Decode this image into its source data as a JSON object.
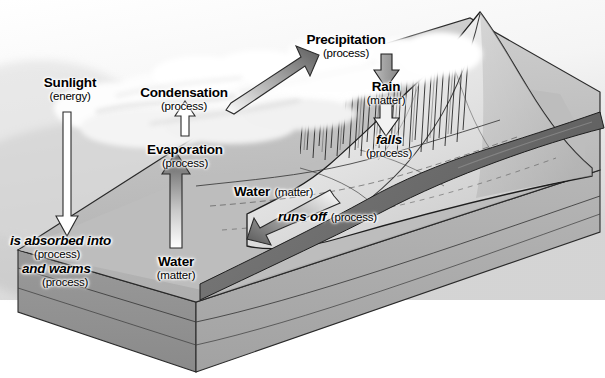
{
  "diagram": {
    "type": "illustrated-flow-diagram",
    "canvas": {
      "width": 605,
      "height": 378,
      "background": "#ffffff"
    },
    "palette": {
      "sky_light": "#f2f2f2",
      "sky_mid": "#d8d8d8",
      "cloud_white": "#fbfbfb",
      "ground_top": "#c9c9c9",
      "ground_mid": "#b4b4b4",
      "mountain_light": "#ededed",
      "river_dark": "#6e6e6e",
      "block_side": "#8f8f8f",
      "block_front": "#a8a8a8",
      "arrow_dark": "#5e5e5e",
      "arrow_light": "#ffffff",
      "outline": "#1a1a1a",
      "text": "#000000"
    },
    "labels": [
      {
        "id": "sunlight",
        "term": "Sunlight",
        "kind": "(energy)",
        "style": "bold",
        "role": "matter-energy"
      },
      {
        "id": "condensation",
        "term": "Condensation",
        "kind": "(process)",
        "style": "bold",
        "role": "process"
      },
      {
        "id": "evaporation",
        "term": "Evaporation",
        "kind": "(process)",
        "style": "bold",
        "role": "process"
      },
      {
        "id": "precipitation",
        "term": "Precipitation",
        "kind": "(process)",
        "style": "bold",
        "role": "process"
      },
      {
        "id": "rain",
        "term": "Rain",
        "kind": "(matter)",
        "style": "bold",
        "role": "matter"
      },
      {
        "id": "falls",
        "term": "falls",
        "kind": "(process)",
        "style": "bold-italic",
        "role": "process"
      },
      {
        "id": "water-mid",
        "term": "Water",
        "kind": "(matter)",
        "style": "bold",
        "role": "matter"
      },
      {
        "id": "runs-off",
        "term": "runs off",
        "kind": "(process)",
        "style": "bold-italic",
        "role": "process"
      },
      {
        "id": "water-bottom",
        "term": "Water",
        "kind": "(matter)",
        "style": "bold",
        "role": "matter"
      },
      {
        "id": "is-absorbed",
        "term": "is absorbed into",
        "kind": "(process)",
        "style": "bold-italic",
        "role": "process"
      },
      {
        "id": "and-warms",
        "term": "and warms",
        "kind": "(process)",
        "style": "bold-italic",
        "role": "process"
      }
    ],
    "arrows": [
      {
        "id": "sunlight-down",
        "from": "Sunlight",
        "to": "is absorbed into",
        "direction": "down",
        "fill": "white-outline"
      },
      {
        "id": "evaporation-up",
        "from": "Water",
        "to": "Evaporation",
        "direction": "up",
        "fill": "white-outline"
      },
      {
        "id": "water-rises-up",
        "from": "Water (matter)",
        "to": "Evaporation",
        "direction": "up",
        "fill": "gradient-light-to-dark"
      },
      {
        "id": "condensation-up-right",
        "from": "Condensation",
        "to": "Precipitation",
        "direction": "up-right",
        "fill": "gradient-light-to-dark"
      },
      {
        "id": "precipitation-down",
        "from": "Precipitation",
        "to": "Rain",
        "direction": "down",
        "fill": "gray"
      },
      {
        "id": "rain-falls-down",
        "from": "Rain",
        "to": "falls",
        "direction": "down",
        "fill": "white-outline"
      },
      {
        "id": "runs-off-left",
        "from": "Water (matter)",
        "to": "runs off",
        "direction": "down-left",
        "fill": "gradient-light-to-dark"
      }
    ],
    "scene_elements": [
      {
        "id": "sky",
        "name": "sky-background"
      },
      {
        "id": "clouds",
        "name": "cloud-bank"
      },
      {
        "id": "mountain",
        "name": "mountain-peak"
      },
      {
        "id": "rain-streaks",
        "name": "rain-streaks"
      },
      {
        "id": "river",
        "name": "river-channel"
      },
      {
        "id": "ground-block",
        "name": "ground-block-3d"
      },
      {
        "id": "soil-layers",
        "name": "soil-strata-layers"
      }
    ]
  }
}
